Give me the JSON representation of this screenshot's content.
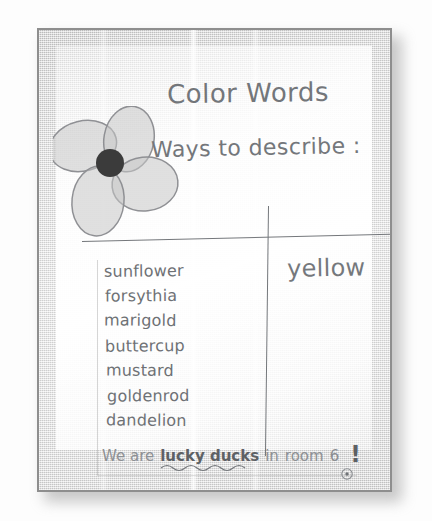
{
  "scene": {
    "kind": "photograph-of-classroom-anchor-chart",
    "medium": "handwritten marker on chart paper"
  },
  "poster": {
    "title": "Color Words",
    "subtitle": "Ways to describe :",
    "color_name": "yellow",
    "word_list_heading": "",
    "words": [
      "sunflower",
      "forsythia",
      "marigold",
      "buttercup",
      "mustard",
      "goldenrod",
      "dandelion"
    ],
    "sentence": {
      "lead": "We are",
      "emphasis": "lucky ducks",
      "middle": "in",
      "room_label": "room",
      "room_number": "6",
      "exclamation": "!"
    },
    "decorations": {
      "flower": "flower-doodle",
      "squiggle": "wavy-underline",
      "dot": "circled-dot"
    }
  },
  "colors": {
    "ink": "#6f7276",
    "ink_light": "#8d9094",
    "paper": "#f2f2f2",
    "board_edge": "#8e8e8e",
    "flower_petal_fill": "#c9c9c9",
    "flower_petal_stroke": "#8f9094",
    "flower_center": "#3b3b3b",
    "background": "#fdfdfd"
  }
}
